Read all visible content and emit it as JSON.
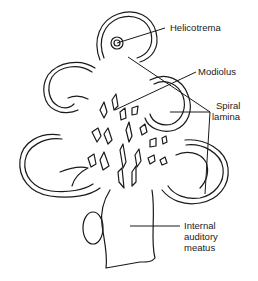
{
  "diagram": {
    "labels": {
      "helicotrema": "Helicotrema",
      "modiolus": "Modiolus",
      "spiral_lamina_line1": "Spiral",
      "spiral_lamina_line2": "lamina",
      "internal_auditory_meatus_line1": "Internal",
      "internal_auditory_meatus_line2": "auditory",
      "internal_auditory_meatus_line3": "meatus"
    },
    "colors": {
      "line": "#1a1a1a",
      "background": "#ffffff"
    }
  }
}
